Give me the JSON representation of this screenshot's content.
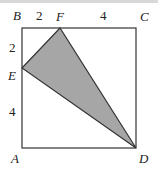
{
  "figure": {
    "type": "square-with-shaded-triangle",
    "points": {
      "A": {
        "label": "A",
        "x": 22,
        "y": 148
      },
      "B": {
        "label": "B",
        "x": 22,
        "y": 28
      },
      "C": {
        "label": "C",
        "x": 136,
        "y": 28
      },
      "D": {
        "label": "D",
        "x": 136,
        "y": 148
      },
      "E": {
        "label": "E",
        "x": 22,
        "y": 68
      },
      "F": {
        "label": "F",
        "x": 60,
        "y": 28
      }
    },
    "lengths": {
      "BF": "2",
      "FC": "4",
      "BE": "2",
      "EA": "4"
    },
    "shaded_triangle": "DEF",
    "colors": {
      "shade": "#a6a6a6",
      "stroke": "#333333"
    }
  }
}
